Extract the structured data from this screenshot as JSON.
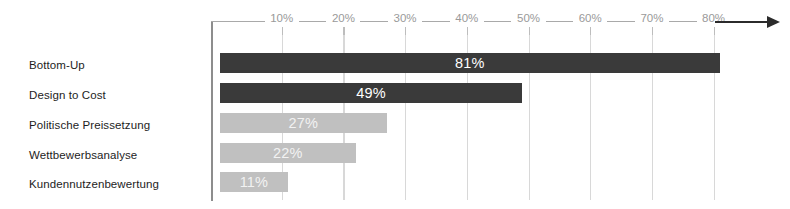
{
  "chart_data": {
    "type": "bar",
    "orientation": "horizontal",
    "title": "",
    "xlabel": "",
    "ylabel": "",
    "categories": [
      "Bottom-Up",
      "Design to Cost",
      "Politische Preissetzung",
      "Wettbewerbsanalyse",
      "Kundennutzenbewertung"
    ],
    "values": [
      81,
      49,
      27,
      22,
      11
    ],
    "value_labels": [
      "81%",
      "49%",
      "27%",
      "22%",
      "11%"
    ],
    "unit": "%",
    "xlim": [
      0,
      85
    ],
    "xticks": [
      10,
      20,
      30,
      40,
      50,
      60,
      70,
      80
    ],
    "xtick_labels": [
      "10%",
      "20%",
      "30%",
      "40%",
      "50%",
      "60%",
      "70%",
      "80%"
    ],
    "grid": true,
    "legend": "none",
    "series": [
      {
        "name": "Anteil",
        "values": [
          81,
          49,
          27,
          22,
          11
        ]
      }
    ],
    "bar_colors": [
      "#3a3a3a",
      "#3a3a3a",
      "#c0c0c0",
      "#c0c0c0",
      "#c0c0c0"
    ],
    "colors": {
      "dark_bar": "#3a3a3a",
      "light_bar": "#c0c0c0",
      "axis": "#a9a9a9",
      "axis_vertical": "#8d8d8d",
      "gridline": "#d8d8d8",
      "tick_text": "#9a9a9a",
      "category_text": "#1d1d1d",
      "value_text": "#ffffff",
      "arrow": "#2b2b2b",
      "background": "#ffffff"
    }
  }
}
